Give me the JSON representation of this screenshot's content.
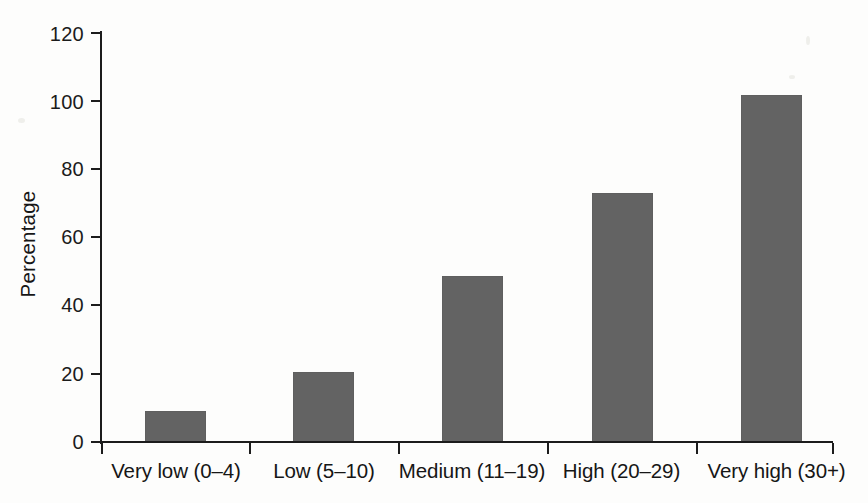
{
  "chart_data": {
    "type": "bar",
    "title": "",
    "subtitle": "",
    "xlabel": "",
    "ylabel": "Percentage",
    "categories": [
      "Very low (0–4)",
      "Low (5–10)",
      "Medium (11–19)",
      "High (20–29)",
      "Very high (30+)"
    ],
    "values": [
      9,
      20.5,
      48.5,
      73,
      101.5
    ],
    "ylim": [
      0,
      120
    ],
    "ytick_labels": [
      "0",
      "20",
      "40",
      "60",
      "80",
      "100",
      "120"
    ],
    "ytick_values": [
      0,
      20,
      40,
      60,
      80,
      100,
      120
    ],
    "grid": false,
    "legend": false,
    "legend_position": "none",
    "bar_color": "#636363",
    "axis_color": "#1c1c1c",
    "background_color": "#fdfdfc",
    "text_color": "#161616"
  }
}
